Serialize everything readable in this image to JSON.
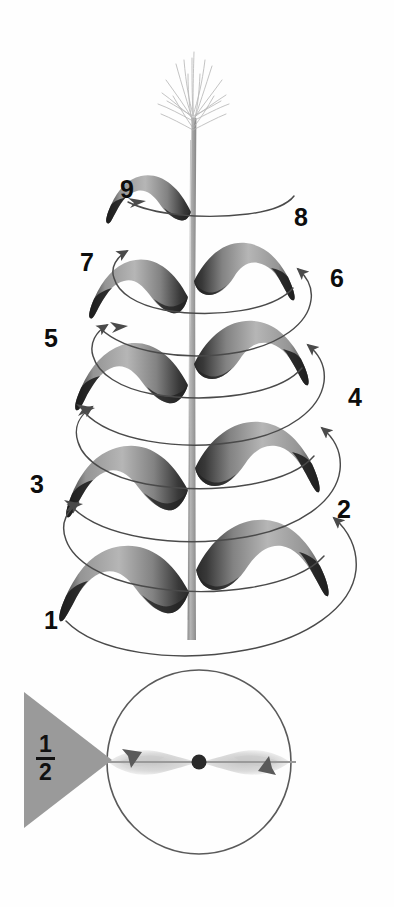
{
  "figure": {
    "background_color": "#ffffff"
  },
  "palette": {
    "leaf_light": "#a9a9a9",
    "leaf_mid": "#8e8e8e",
    "leaf_dark": "#3a3a3a",
    "leaf_darkest": "#1c1c1c",
    "stem": "#a3a3a3",
    "stem_edge": "#8a8a8a",
    "tassel": "#b9b9b9",
    "spiral_line": "#4a4a4a",
    "circle_line": "#5a5a5a",
    "label_text": "#0d0d0d",
    "triangle_fill": "#9a9a9a",
    "center_dot": "#2a2a2a",
    "cross_leaf": "#c9c9c9"
  },
  "plant": {
    "name": "maize-plant",
    "stem_label": "stem",
    "tassel_label": "tassel",
    "leaf_count": 9
  },
  "leaf_labels": [
    {
      "id": "leaf-label-1",
      "text": "1",
      "x": 44,
      "y": 608,
      "side": "left"
    },
    {
      "id": "leaf-label-2",
      "text": "2",
      "x": 337,
      "y": 497,
      "side": "right"
    },
    {
      "id": "leaf-label-3",
      "text": "3",
      "x": 30,
      "y": 472,
      "side": "left"
    },
    {
      "id": "leaf-label-4",
      "text": "4",
      "x": 348,
      "y": 385,
      "side": "right"
    },
    {
      "id": "leaf-label-5",
      "text": "5",
      "x": 44,
      "y": 326,
      "side": "left"
    },
    {
      "id": "leaf-label-6",
      "text": "6",
      "x": 330,
      "y": 266,
      "side": "right"
    },
    {
      "id": "leaf-label-7",
      "text": "7",
      "x": 80,
      "y": 250,
      "side": "left"
    },
    {
      "id": "leaf-label-8",
      "text": "8",
      "x": 294,
      "y": 205,
      "side": "right"
    },
    {
      "id": "leaf-label-9",
      "text": "9",
      "x": 120,
      "y": 177,
      "side": "left"
    }
  ],
  "cross_section": {
    "name": "cross-section-diagram",
    "caption_fraction_numerator": "1",
    "caption_fraction_denominator": "2",
    "divergence_note": "1/2",
    "center_dot_label": "stem-axis",
    "arrow_left_label": "leaf-direction-left",
    "arrow_right_label": "leaf-direction-right"
  }
}
